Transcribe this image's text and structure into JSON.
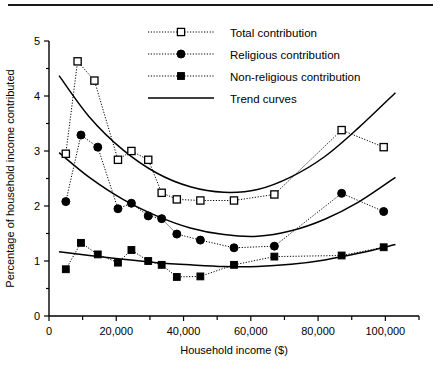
{
  "figure": {
    "top_rule": true,
    "background": "#ffffff",
    "ink": "#000000"
  },
  "chart_data": {
    "type": "line",
    "title": "",
    "xlabel": "Household income ($)",
    "ylabel": "Percentage of household income contributed",
    "xlim": [
      0,
      110000
    ],
    "ylim": [
      0,
      5
    ],
    "grid": false,
    "legend_position": "top-right-inside",
    "x_ticks": [
      0,
      20000,
      40000,
      60000,
      80000,
      100000
    ],
    "x_tick_labels": [
      "0",
      "20,000",
      "40,000",
      "60,000",
      "80,000",
      "100,000"
    ],
    "x_minor_ticks": [
      10000,
      30000,
      50000,
      70000,
      90000,
      110000
    ],
    "y_ticks": [
      0,
      1,
      2,
      3,
      4,
      5
    ],
    "y_tick_labels": [
      "0",
      "1",
      "2",
      "3",
      "4",
      "5"
    ],
    "y_minor_ticks": [
      0.5,
      1.5,
      2.5,
      3.5,
      4.5
    ],
    "series": [
      {
        "name": "Total contribution",
        "marker": "open-square",
        "linestyle": "dotted",
        "x": [
          5000,
          8500,
          13500,
          20500,
          24500,
          29500,
          33500,
          38000,
          45000,
          55000,
          67000,
          87000,
          99500
        ],
        "values": [
          2.95,
          4.63,
          4.28,
          2.84,
          3.0,
          2.84,
          2.24,
          2.12,
          2.1,
          2.1,
          2.21,
          3.38,
          3.07
        ]
      },
      {
        "name": "Religious contribution",
        "marker": "filled-circle",
        "linestyle": "dotted",
        "x": [
          5000,
          9500,
          14500,
          20500,
          24500,
          29500,
          33500,
          38000,
          45000,
          55000,
          67000,
          87000,
          99500
        ],
        "values": [
          2.08,
          3.29,
          3.07,
          1.95,
          2.05,
          1.82,
          1.77,
          1.49,
          1.38,
          1.24,
          1.27,
          2.23,
          1.9
        ]
      },
      {
        "name": "Non-religious contribution",
        "marker": "filled-square",
        "linestyle": "dotted",
        "x": [
          5000,
          9500,
          14500,
          20500,
          24500,
          29500,
          33500,
          38000,
          45000,
          55000,
          67000,
          87000,
          99500
        ],
        "values": [
          0.85,
          1.33,
          1.12,
          0.97,
          1.2,
          1.0,
          0.93,
          0.71,
          0.72,
          0.93,
          1.08,
          1.1,
          1.25
        ]
      }
    ],
    "trend_curves": [
      {
        "name": "Total contribution trend",
        "for_series": "Total contribution",
        "points_x": [
          3000,
          12000,
          22000,
          32000,
          42000,
          52000,
          62000,
          72000,
          82000,
          92000,
          103000
        ],
        "points_y": [
          4.37,
          3.62,
          3.02,
          2.6,
          2.35,
          2.25,
          2.3,
          2.53,
          2.9,
          3.42,
          4.06
        ]
      },
      {
        "name": "Religious contribution trend",
        "for_series": "Religious contribution",
        "points_x": [
          3000,
          12000,
          22000,
          32000,
          42000,
          52000,
          62000,
          72000,
          82000,
          92000,
          103000
        ],
        "points_y": [
          2.97,
          2.52,
          2.12,
          1.82,
          1.6,
          1.48,
          1.45,
          1.55,
          1.76,
          2.07,
          2.52
        ]
      },
      {
        "name": "Non-religious contribution trend",
        "for_series": "Non-religious contribution",
        "points_x": [
          3000,
          12000,
          22000,
          32000,
          42000,
          52000,
          62000,
          72000,
          82000,
          92000,
          103000
        ],
        "points_y": [
          1.17,
          1.1,
          1.03,
          0.97,
          0.93,
          0.9,
          0.9,
          0.94,
          1.02,
          1.14,
          1.3
        ]
      }
    ],
    "legend": [
      {
        "label": "Total contribution",
        "marker": "open-square",
        "linestyle": "dotted"
      },
      {
        "label": "Religious contribution",
        "marker": "filled-circle",
        "linestyle": "dotted"
      },
      {
        "label": "Non-religious contribution",
        "marker": "filled-square",
        "linestyle": "dotted"
      },
      {
        "label": "Trend curves",
        "marker": "none",
        "linestyle": "solid"
      }
    ]
  }
}
